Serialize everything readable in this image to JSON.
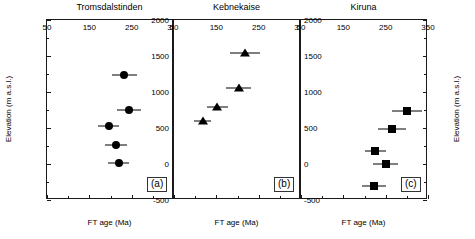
{
  "figure": {
    "xlabel": "FT age (Ma)",
    "ylabel": "Elevation (m a.s.l.)"
  },
  "axes": {
    "x_major_labels": [
      "50",
      "150",
      "250",
      "350"
    ],
    "x_major_values": [
      50,
      150,
      250,
      350
    ],
    "x_minor_values": [
      100,
      200,
      300
    ],
    "y_major_labels": [
      "2000",
      "1500",
      "1000",
      "500",
      "0",
      "-500"
    ],
    "y_major_values": [
      2000,
      1500,
      1000,
      500,
      0,
      -500
    ],
    "y_minor_values": [
      1750,
      1250,
      750,
      250,
      -250
    ]
  },
  "panels": [
    {
      "id": "a",
      "title": "Tromsdalstinden",
      "label": "(a)"
    },
    {
      "id": "b",
      "title": "Kebnekaise",
      "label": "(b)"
    },
    {
      "id": "c",
      "title": "Kiruna",
      "label": "(c)"
    }
  ],
  "chart_data": [
    {
      "type": "scatter",
      "title": "Tromsdalstinden",
      "panel": "(a)",
      "xlabel": "FT age (Ma)",
      "ylabel": "Elevation (m a.s.l.)",
      "xlim": [
        50,
        350
      ],
      "ylim": [
        -500,
        2000
      ],
      "marker": "circle",
      "grid": false,
      "legend": "none",
      "x": [
        233,
        243,
        196,
        213,
        219
      ],
      "y": [
        1240,
        755,
        530,
        265,
        10
      ],
      "xerr": [
        30,
        28,
        25,
        26,
        25
      ],
      "points": [
        {
          "x": 233,
          "y": 1240,
          "xerr": 30
        },
        {
          "x": 243,
          "y": 755,
          "xerr": 28
        },
        {
          "x": 196,
          "y": 530,
          "xerr": 25
        },
        {
          "x": 213,
          "y": 265,
          "xerr": 26
        },
        {
          "x": 219,
          "y": 10,
          "xerr": 25
        }
      ]
    },
    {
      "type": "scatter",
      "title": "Kebnekaise",
      "panel": "(b)",
      "xlabel": "FT age (Ma)",
      "ylabel": "Elevation (m a.s.l.)",
      "xlim": [
        50,
        350
      ],
      "ylim": [
        -500,
        2000
      ],
      "marker": "triangle",
      "grid": false,
      "legend": "none",
      "x": [
        217,
        203,
        152,
        118
      ],
      "y": [
        1540,
        1060,
        790,
        600
      ],
      "xerr": [
        35,
        30,
        25,
        20
      ],
      "points": [
        {
          "x": 217,
          "y": 1540,
          "xerr": 35
        },
        {
          "x": 203,
          "y": 1060,
          "xerr": 30
        },
        {
          "x": 152,
          "y": 790,
          "xerr": 25
        },
        {
          "x": 118,
          "y": 600,
          "xerr": 20
        }
      ]
    },
    {
      "type": "scatter",
      "title": "Kiruna",
      "panel": "(c)",
      "xlabel": "FT age (Ma)",
      "ylabel": "Elevation (m a.s.l.)",
      "xlim": [
        50,
        350
      ],
      "ylim": [
        -500,
        2000
      ],
      "marker": "square",
      "grid": false,
      "legend": "none",
      "x": [
        300,
        265,
        225,
        250,
        222
      ],
      "y": [
        730,
        480,
        180,
        0,
        -300
      ],
      "xerr": [
        35,
        33,
        25,
        30,
        28
      ],
      "points": [
        {
          "x": 300,
          "y": 730,
          "xerr": 35
        },
        {
          "x": 265,
          "y": 480,
          "xerr": 33
        },
        {
          "x": 225,
          "y": 180,
          "xerr": 25
        },
        {
          "x": 250,
          "y": 0,
          "xerr": 30
        },
        {
          "x": 222,
          "y": -300,
          "xerr": 28
        }
      ]
    }
  ]
}
